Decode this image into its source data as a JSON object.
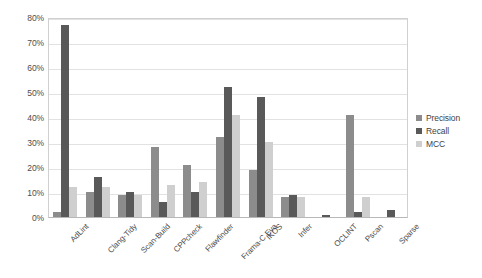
{
  "chart_data": {
    "type": "bar",
    "title": "",
    "subtitle": "",
    "xlabel": "",
    "ylabel": "",
    "ylim": [
      0,
      80
    ],
    "ytick_labels": [
      "0%",
      "10%",
      "20%",
      "30%",
      "40%",
      "50%",
      "60%",
      "70%",
      "80%"
    ],
    "ytick_values": [
      0,
      10,
      20,
      30,
      40,
      50,
      60,
      70,
      80
    ],
    "grid": true,
    "legend_position": "right",
    "value_suffix": "%",
    "categories": [
      "AdLint",
      "Clang-Tidy",
      "Scan-Build",
      "CPPcheck",
      "Flawfinder",
      "Frama-C Eva",
      "IKOS",
      "Infer",
      "OCLINT",
      "Pscan",
      "Sparse"
    ],
    "series": [
      {
        "name": "Precision",
        "color": "#8c8c8c",
        "values": [
          2,
          10,
          9,
          28,
          21,
          32,
          19,
          8,
          0,
          41,
          0
        ]
      },
      {
        "name": "Recall",
        "color": "#595959",
        "values": [
          77,
          16,
          10,
          6,
          10,
          52,
          48,
          9,
          1,
          2,
          3
        ]
      },
      {
        "name": "MCC",
        "color": "#cfcfcf",
        "values": [
          12,
          12,
          9,
          13,
          14,
          41,
          30,
          8,
          0,
          8,
          0
        ]
      }
    ]
  },
  "colors": {
    "precision": "#8c8c8c",
    "recall": "#595959",
    "mcc": "#cfcfcf",
    "gridline": "#e2e2e2",
    "axis": "#b8b8b8",
    "text": "#4a4a4a",
    "background": "#ffffff"
  }
}
